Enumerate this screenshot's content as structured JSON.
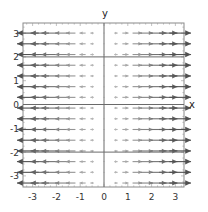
{
  "chart_data": {
    "type": "vector_field",
    "title": "",
    "field": "F(x, y) = (x, 0)",
    "xlabel": "x",
    "ylabel": "y",
    "xlim": [
      -3.4,
      3.4
    ],
    "ylim": [
      -3.5,
      3.4
    ],
    "xticks": [
      -3,
      -2,
      -1,
      0,
      1,
      2,
      3
    ],
    "yticks": [
      -3,
      -2,
      -1,
      0,
      1,
      2,
      3
    ],
    "xtick_labels": [
      "-3",
      "-2",
      "-1",
      "0",
      "1",
      "2",
      "3"
    ],
    "ytick_labels": [
      "-3",
      "-2",
      "-1",
      "0",
      "1",
      "2",
      "3"
    ],
    "grid": false,
    "grid_points": {
      "x": [
        -3.2,
        -2.7,
        -2.3,
        -1.8,
        -1.4,
        -0.9,
        -0.5,
        0.0,
        0.5,
        0.9,
        1.4,
        1.8,
        2.3,
        2.7,
        3.2
      ],
      "y": [
        3.0,
        2.55,
        2.1,
        1.65,
        1.2,
        0.75,
        0.3,
        -0.15,
        -0.6,
        -1.05,
        -1.5,
        -1.95,
        -2.4,
        -2.85,
        -3.3
      ]
    },
    "horizontal_lines": [
      2,
      0,
      -2
    ],
    "vertical_lines": [
      0
    ],
    "arrow_color": "#555555",
    "line_color": "#666666",
    "frame_color": "#888888"
  },
  "labels": {
    "x_axis": "x",
    "y_axis": "y"
  }
}
